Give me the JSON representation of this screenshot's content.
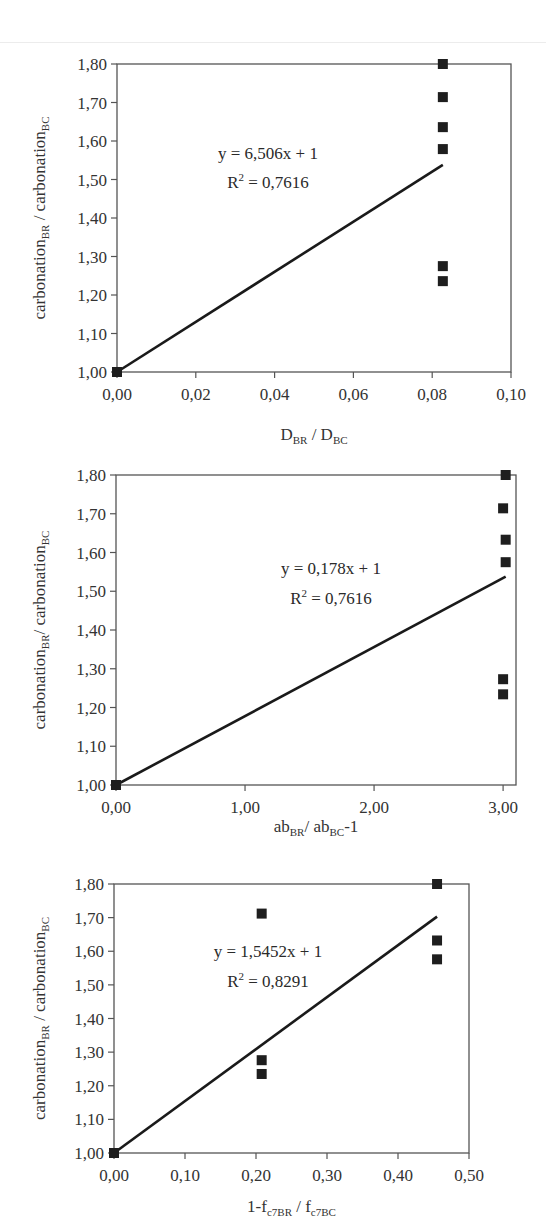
{
  "chart_data": [
    {
      "type": "scatter",
      "title": "",
      "xlabel": "D_BR / D_BC",
      "xlabel_parts": [
        {
          "t": "D",
          "s": ""
        },
        {
          "t": "BR",
          "s": "sub"
        },
        {
          "t": " / D",
          "s": ""
        },
        {
          "t": "BC",
          "s": "sub"
        }
      ],
      "ylabel": "carbonation_BR / carbonation_BC",
      "ylabel_parts": [
        {
          "t": "carbonation",
          "s": ""
        },
        {
          "t": "BR",
          "s": "sub"
        },
        {
          "t": " / carbonation",
          "s": ""
        },
        {
          "t": "BC",
          "s": "sub"
        }
      ],
      "xlim": [
        0,
        0.1
      ],
      "ylim": [
        1.0,
        1.8
      ],
      "xticks": [
        "0,00",
        "0,02",
        "0,04",
        "0,06",
        "0,08",
        "0,10"
      ],
      "xtick_values": [
        0,
        0.02,
        0.04,
        0.06,
        0.08,
        0.1
      ],
      "yticks": [
        "1,00",
        "1,10",
        "1,20",
        "1,30",
        "1,40",
        "1,50",
        "1,60",
        "1,70",
        "1,80"
      ],
      "ytick_values": [
        1.0,
        1.1,
        1.2,
        1.3,
        1.4,
        1.5,
        1.6,
        1.7,
        1.8
      ],
      "grid": false,
      "legend": "none",
      "points": [
        {
          "x": 0.0,
          "y": 1.0
        },
        {
          "x": 0.0827,
          "y": 1.8
        },
        {
          "x": 0.0827,
          "y": 1.714
        },
        {
          "x": 0.0827,
          "y": 1.636
        },
        {
          "x": 0.0827,
          "y": 1.579
        },
        {
          "x": 0.0827,
          "y": 1.275
        },
        {
          "x": 0.0827,
          "y": 1.236
        }
      ],
      "trendline": {
        "slope": 6.506,
        "intercept": 1,
        "x_range": [
          0,
          0.0827
        ]
      },
      "annotations": {
        "equation": "y = 6,506x + 1",
        "r2_label": "R",
        "r2_sup": "2",
        "r2_value": " = 0,7616"
      }
    },
    {
      "type": "scatter",
      "title": "",
      "xlabel": "ab_BR/ ab_BC-1",
      "xlabel_parts": [
        {
          "t": "ab",
          "s": ""
        },
        {
          "t": "BR",
          "s": "sub"
        },
        {
          "t": "/ ab",
          "s": ""
        },
        {
          "t": "BC",
          "s": "sub"
        },
        {
          "t": "-1",
          "s": ""
        }
      ],
      "ylabel": "carbonation_BR/ carbonation_BC",
      "ylabel_parts": [
        {
          "t": "carbonation",
          "s": ""
        },
        {
          "t": "BR",
          "s": "sub"
        },
        {
          "t": "/ carbonation",
          "s": ""
        },
        {
          "t": "BC",
          "s": "sub"
        }
      ],
      "xlim": [
        0,
        3.1
      ],
      "ylim": [
        1.0,
        1.8
      ],
      "xticks": [
        "0,00",
        "1,00",
        "2,00",
        "3,00"
      ],
      "xtick_values": [
        0,
        1,
        2,
        3
      ],
      "yticks": [
        "1,00",
        "1,10",
        "1,20",
        "1,30",
        "1,40",
        "1,50",
        "1,60",
        "1,70",
        "1,80"
      ],
      "ytick_values": [
        1.0,
        1.1,
        1.2,
        1.3,
        1.4,
        1.5,
        1.6,
        1.7,
        1.8
      ],
      "grid": false,
      "legend": "none",
      "points": [
        {
          "x": 0.0,
          "y": 1.0
        },
        {
          "x": 3.02,
          "y": 1.8
        },
        {
          "x": 3.0,
          "y": 1.714
        },
        {
          "x": 3.02,
          "y": 1.633
        },
        {
          "x": 3.02,
          "y": 1.575
        },
        {
          "x": 3.0,
          "y": 1.273
        },
        {
          "x": 3.0,
          "y": 1.234
        }
      ],
      "trendline": {
        "slope": 0.178,
        "intercept": 1,
        "x_range": [
          0,
          3.02
        ]
      },
      "annotations": {
        "equation": "y = 0,178x + 1",
        "r2_label": "R",
        "r2_sup": "2",
        "r2_value": " = 0,7616"
      }
    },
    {
      "type": "scatter",
      "title": "",
      "xlabel": "1-f_c7BR / f_c7BC",
      "xlabel_parts": [
        {
          "t": "1-f",
          "s": ""
        },
        {
          "t": "c7BR",
          "s": "sub"
        },
        {
          "t": " / f",
          "s": ""
        },
        {
          "t": "c7BC",
          "s": "sub"
        }
      ],
      "ylabel": "carbonation_BR / carbonation_BC",
      "ylabel_parts": [
        {
          "t": "carbonation",
          "s": ""
        },
        {
          "t": "BR",
          "s": "sub"
        },
        {
          "t": " / carbonation",
          "s": ""
        },
        {
          "t": "BC",
          "s": "sub"
        }
      ],
      "xlim": [
        0,
        0.5
      ],
      "ylim": [
        1.0,
        1.8
      ],
      "xticks": [
        "0,00",
        "0,10",
        "0,20",
        "0,30",
        "0,40",
        "0,50"
      ],
      "xtick_values": [
        0,
        0.1,
        0.2,
        0.3,
        0.4,
        0.5
      ],
      "yticks": [
        "1,00",
        "1,10",
        "1,20",
        "1,30",
        "1,40",
        "1,50",
        "1,60",
        "1,70",
        "1,80"
      ],
      "ytick_values": [
        1.0,
        1.1,
        1.2,
        1.3,
        1.4,
        1.5,
        1.6,
        1.7,
        1.8
      ],
      "grid": false,
      "legend": "none",
      "points": [
        {
          "x": 0.0,
          "y": 1.0
        },
        {
          "x": 0.208,
          "y": 1.712
        },
        {
          "x": 0.208,
          "y": 1.276
        },
        {
          "x": 0.208,
          "y": 1.235
        },
        {
          "x": 0.455,
          "y": 1.8
        },
        {
          "x": 0.455,
          "y": 1.632
        },
        {
          "x": 0.455,
          "y": 1.576
        }
      ],
      "trendline": {
        "slope": 1.5452,
        "intercept": 1,
        "x_range": [
          0,
          0.455
        ]
      },
      "annotations": {
        "equation": "y = 1,5452x + 1",
        "r2_label": "R",
        "r2_sup": "2",
        "r2_value": " = 0,8291"
      }
    }
  ],
  "layout": [
    {
      "top": 0,
      "plot": {
        "x0": 117,
        "y0": 64,
        "x1": 511,
        "y1": 372
      },
      "eq_x": 268,
      "eq_y": 159,
      "r2_y": 188,
      "xlabel_y": 440,
      "ylabel_x": 45
    },
    {
      "top": 0,
      "plot": {
        "x0": 116,
        "y0": 475,
        "x1": 516,
        "y1": 785
      },
      "x_axis_end": 3.0,
      "eq_x": 331,
      "eq_y": 574,
      "r2_y": 604,
      "xlabel_y": 832,
      "ylabel_x": 45
    },
    {
      "top": 0,
      "plot": {
        "x0": 114,
        "y0": 884,
        "x1": 469,
        "y1": 1153
      },
      "eq_x": 268,
      "eq_y": 957,
      "r2_y": 987,
      "xlabel_y": 1212,
      "ylabel_x": 45
    }
  ]
}
